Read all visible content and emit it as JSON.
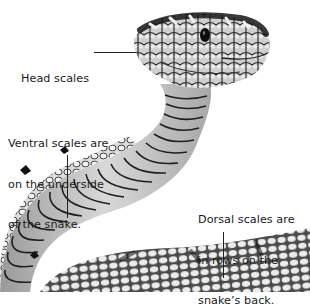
{
  "diagram": {
    "colors": {
      "background": "#ffffff",
      "text": "#1a1a1a",
      "scale_light": "#e6e6e6",
      "scale_mid": "#b5b5b5",
      "scale_dark": "#1c1c1c"
    },
    "labels": {
      "head": {
        "lines": [
          "Head scales"
        ]
      },
      "ventral": {
        "lines": [
          "Ventral scales are",
          "on the underside",
          "of the snake."
        ]
      },
      "dorsal": {
        "lines": [
          "Dorsal scales are",
          "in rows on the",
          "snake’s back."
        ]
      }
    }
  }
}
